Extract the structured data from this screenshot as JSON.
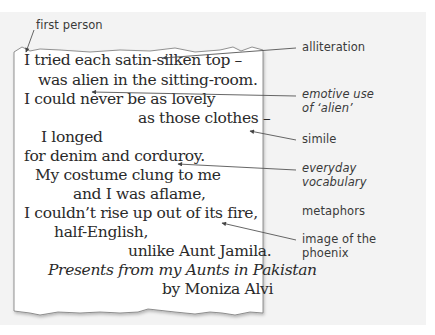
{
  "poem": {
    "lines": [
      {
        "text": "I tried each satin-silken top –",
        "x": 24,
        "y": 53,
        "italic": false
      },
      {
        "text": "was alien in the sitting-room.",
        "x": 38,
        "y": 73,
        "italic": false
      },
      {
        "text": "I could never be as lovely",
        "x": 24,
        "y": 92,
        "italic": false
      },
      {
        "text": "as those clothes –",
        "x": 138,
        "y": 111,
        "italic": false
      },
      {
        "text": "I longed",
        "x": 41,
        "y": 130,
        "italic": false
      },
      {
        "text": "for denim and corduroy.",
        "x": 24,
        "y": 149,
        "italic": false
      },
      {
        "text": "My costume clung to me",
        "x": 35,
        "y": 168,
        "italic": false
      },
      {
        "text": "and I was aflame,",
        "x": 73,
        "y": 187,
        "italic": false
      },
      {
        "text": "I couldn’t rise up out of its fire,",
        "x": 24,
        "y": 206,
        "italic": false
      },
      {
        "text": "half-English,",
        "x": 54,
        "y": 225,
        "italic": false
      },
      {
        "text": "unlike Aunt Jamila.",
        "x": 128,
        "y": 244,
        "italic": false
      },
      {
        "text": "Presents from my Aunts in Pakistan",
        "x": 48,
        "y": 263,
        "italic": true
      },
      {
        "text": "by Moniza Alvi",
        "x": 162,
        "y": 282,
        "italic": false
      }
    ]
  },
  "annotations": [
    {
      "id": "first-person",
      "text": "first person",
      "x": 36,
      "y": 18,
      "italic": false
    },
    {
      "id": "alliteration",
      "text": "alliteration",
      "x": 302,
      "y": 40,
      "italic": false
    },
    {
      "id": "emotive",
      "text": "emotive use\nof ‘alien’",
      "x": 302,
      "y": 87,
      "italic": true
    },
    {
      "id": "simile",
      "text": "simile",
      "x": 302,
      "y": 132,
      "italic": false
    },
    {
      "id": "everyday",
      "text": "everyday\nvocabulary",
      "x": 302,
      "y": 161,
      "italic": true
    },
    {
      "id": "metaphors",
      "text": "metaphors",
      "x": 302,
      "y": 204,
      "italic": false
    },
    {
      "id": "phoenix",
      "text": "image of the\nphoenix",
      "x": 302,
      "y": 232,
      "italic": false
    }
  ],
  "colors": {
    "background": "#f3f3f3",
    "paper": "#ffffff",
    "ink": "#2a2a2a",
    "arrow": "#555555"
  }
}
